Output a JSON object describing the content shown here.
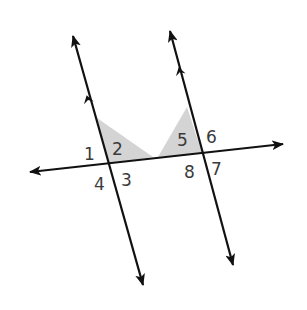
{
  "diagram": {
    "colors": {
      "line": "#111111",
      "shading": "#d4d4d4",
      "label": "#3a3a3a"
    },
    "lines": [
      {
        "name": "parallel-line-left",
        "x1": 73,
        "y1": 36,
        "x2": 143,
        "y2": 285,
        "parallel_marker": {
          "x": 88,
          "y": 100
        }
      },
      {
        "name": "parallel-line-right",
        "x1": 170,
        "y1": 31,
        "x2": 233,
        "y2": 265,
        "parallel_marker": {
          "x": 180,
          "y": 72
        }
      },
      {
        "name": "transversal",
        "x1": 30,
        "y1": 172,
        "x2": 283,
        "y2": 144
      }
    ],
    "shaded_regions": [
      {
        "name": "shaded-angle-2",
        "points": "97,118 108,164 153,157"
      },
      {
        "name": "shaded-angle-5",
        "points": "187,107 202,153 158,157"
      }
    ],
    "angle_labels": [
      {
        "text": "1",
        "x": 84,
        "y": 160
      },
      {
        "text": "2",
        "x": 112,
        "y": 155
      },
      {
        "text": "3",
        "x": 121,
        "y": 186
      },
      {
        "text": "4",
        "x": 94,
        "y": 190
      },
      {
        "text": "5",
        "x": 177,
        "y": 146
      },
      {
        "text": "6",
        "x": 206,
        "y": 143
      },
      {
        "text": "7",
        "x": 211,
        "y": 175
      },
      {
        "text": "8",
        "x": 184,
        "y": 178
      }
    ]
  }
}
